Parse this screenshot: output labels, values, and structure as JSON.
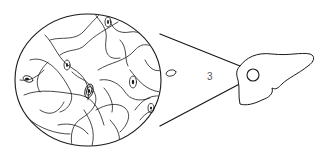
{
  "diagram": {
    "label": "3",
    "line_color": "#1a1a1a",
    "background": "#ffffff",
    "components": [
      {
        "name": "magnified-tissue-oval",
        "content": "branching hepatic cells with nuclei"
      },
      {
        "name": "magnification-cone",
        "content": "two lines connecting oval to sample point"
      },
      {
        "name": "sample-point-circle",
        "content": "small circle on liver"
      },
      {
        "name": "liver-outline",
        "content": "organ silhouette"
      }
    ]
  }
}
